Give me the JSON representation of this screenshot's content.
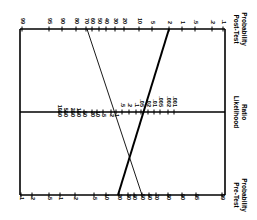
{
  "orientation": "rotated 90 degrees clockwise",
  "axes": {
    "post_test": {
      "title_line1": "Post-Test",
      "title_line2": "Probability",
      "y": 29,
      "ticks": [
        {
          "label": "99",
          "x": 22
        },
        {
          "label": "95",
          "x": 49
        },
        {
          "label": "90",
          "x": 62
        },
        {
          "label": "80",
          "x": 76
        },
        {
          "label": "70",
          "x": 86
        },
        {
          "label": "60",
          "x": 92
        },
        {
          "label": "50",
          "x": 99
        },
        {
          "label": "40",
          "x": 106
        },
        {
          "label": "30",
          "x": 115
        },
        {
          "label": "20",
          "x": 124
        },
        {
          "label": "10",
          "x": 139
        },
        {
          "label": "5",
          "x": 152
        },
        {
          "label": "2",
          "x": 169
        },
        {
          "label": "1",
          "x": 182
        },
        {
          "label": ".5",
          "x": 195
        },
        {
          "label": ".2",
          "x": 212
        },
        {
          "label": ".1",
          "x": 223
        }
      ]
    },
    "likelihood_ratio": {
      "title_line1": "Likelihood",
      "title_line2": "Ratio",
      "y": 112,
      "ticks": [
        {
          "label": "1000",
          "x": 59
        },
        {
          "label": "500",
          "x": 65
        },
        {
          "label": "200",
          "x": 72
        },
        {
          "label": "100",
          "x": 78
        },
        {
          "label": "50",
          "x": 84
        },
        {
          "label": "20",
          "x": 92
        },
        {
          "label": "10",
          "x": 97
        },
        {
          "label": "5",
          "x": 103
        },
        {
          "label": "2",
          "x": 111
        },
        {
          "label": "1",
          "x": 116
        },
        {
          "label": ".5",
          "x": 122
        },
        {
          "label": ".2",
          "x": 129
        },
        {
          "label": ".1",
          "x": 136
        },
        {
          "label": ".05",
          "x": 141
        },
        {
          "label": ".02",
          "x": 148
        },
        {
          "label": ".01",
          "x": 154
        },
        {
          "label": ".005",
          "x": 160
        },
        {
          "label": ".002",
          "x": 168
        },
        {
          "label": ".001",
          "x": 174
        }
      ]
    },
    "pre_test": {
      "title_line1": "Pre-Test",
      "title_line2": "Probability",
      "y": 195,
      "ticks": [
        {
          "label": ".1",
          "x": 21
        },
        {
          "label": ".2",
          "x": 32
        },
        {
          "label": ".5",
          "x": 49
        },
        {
          "label": "1",
          "x": 60
        },
        {
          "label": "2",
          "x": 75
        },
        {
          "label": "5",
          "x": 94
        },
        {
          "label": "10",
          "x": 106
        },
        {
          "label": "20",
          "x": 119
        },
        {
          "label": "30",
          "x": 128
        },
        {
          "label": "40",
          "x": 134
        },
        {
          "label": "50",
          "x": 142
        },
        {
          "label": "60",
          "x": 149
        },
        {
          "label": "70",
          "x": 156
        },
        {
          "label": "80",
          "x": 168
        },
        {
          "label": "90",
          "x": 182
        },
        {
          "label": "95",
          "x": 196
        },
        {
          "label": "99",
          "x": 222
        }
      ]
    }
  },
  "lines": [
    {
      "name": "thick-line",
      "pre_test": "20",
      "x1": 118,
      "y1": 195,
      "x2": 169,
      "y2": 29,
      "width": 2
    },
    {
      "name": "thin-line",
      "pre_test": "50",
      "x1": 142,
      "y1": 195,
      "x2": 87,
      "y2": 29,
      "width": 0.9
    }
  ],
  "frame": {
    "left": 20,
    "right": 225,
    "top": 29,
    "bottom": 195
  }
}
